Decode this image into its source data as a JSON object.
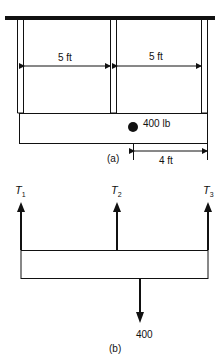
{
  "figure_a": {
    "caption": "(a)",
    "span_left_label": "5 ft",
    "span_right_label": "5 ft",
    "load_label": "400 lb",
    "load_offset_label": "4 ft"
  },
  "figure_b": {
    "caption": "(b)",
    "tensions": [
      {
        "symbol": "T",
        "subscript": "1"
      },
      {
        "symbol": "T",
        "subscript": "2"
      },
      {
        "symbol": "T",
        "subscript": "3"
      }
    ],
    "load_label": "400"
  },
  "colors": {
    "ink": "#111111",
    "background": "#ffffff"
  }
}
